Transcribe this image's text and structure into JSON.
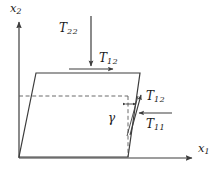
{
  "figure": {
    "background_color": "#ffffff",
    "line_color": "#3d3d3d",
    "text_color": "#1a1a1a"
  },
  "axes": {
    "horizontal": {
      "label_base": "x",
      "label_sub": "1",
      "direction": "right"
    },
    "vertical": {
      "label_base": "x",
      "label_sub": "2",
      "direction": "up"
    },
    "origin": {
      "x": 19,
      "y": 158
    }
  },
  "shape": {
    "name": "parallelogram",
    "vertices": [
      {
        "x": 19,
        "y": 157
      },
      {
        "x": 128,
        "y": 157
      },
      {
        "x": 140,
        "y": 73
      },
      {
        "x": 36,
        "y": 73
      }
    ],
    "fill": "none",
    "stroke": "#3d3d3d"
  },
  "reference_lines": {
    "style": "dashed",
    "horizontal": {
      "x1": 19,
      "y1": 96,
      "x2": 128,
      "y2": 96
    },
    "vertical": {
      "x1": 128,
      "y1": 96,
      "x2": 128,
      "y2": 157
    }
  },
  "angle": {
    "symbol": "γ",
    "name": "shear-angle-gamma",
    "description": "angle between undeformed vertical reference and deformed edge"
  },
  "stresses": [
    {
      "id": "T22",
      "base": "T",
      "sub": "22",
      "arrow": "downward",
      "position": "top-center-above-element"
    },
    {
      "id": "T12-top",
      "base": "T",
      "sub": "12",
      "arrow": "rightward",
      "position": "along-top-edge"
    },
    {
      "id": "T12-right",
      "base": "T",
      "sub": "12",
      "arrow": "upward-slanted",
      "position": "along-right-edge"
    },
    {
      "id": "T11",
      "base": "T",
      "sub": "11",
      "arrow": "leftward",
      "position": "right-side-normal"
    }
  ]
}
